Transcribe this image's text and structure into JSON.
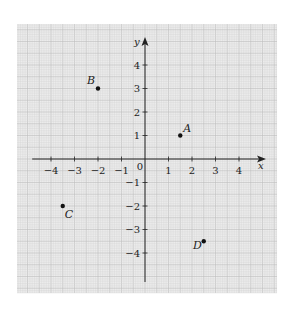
{
  "colors": {
    "page_bg": "#ffffff",
    "grid_bg": "#ececec",
    "grid_minor": "#d4d4d4",
    "grid_major": "#bdbdbd",
    "axis": "#222222",
    "point": "#111111"
  },
  "chart_data": {
    "type": "scatter",
    "title": "",
    "xlabel": "x",
    "ylabel": "y",
    "xlim": [
      -4.8,
      4.9
    ],
    "ylim": [
      -5.2,
      5.2
    ],
    "grid": true,
    "x_ticks": [
      -4,
      -3,
      -2,
      -1,
      1,
      2,
      3,
      4
    ],
    "y_ticks": [
      -4,
      -3,
      -2,
      -1,
      1,
      2,
      3,
      4
    ],
    "x_tick_labels": [
      "−4",
      "−3",
      "−2",
      "−1",
      "1",
      "2",
      "3",
      "4"
    ],
    "y_tick_labels": [
      "−4",
      "−3",
      "−2",
      "−1",
      "1",
      "2",
      "3",
      "4"
    ],
    "origin_label": "0",
    "points": [
      {
        "label": "A",
        "x": 1.5,
        "y": 1,
        "label_pos": "above-right"
      },
      {
        "label": "B",
        "x": -2,
        "y": 3,
        "label_pos": "above-left"
      },
      {
        "label": "C",
        "x": -3.5,
        "y": -2,
        "label_pos": "below-right"
      },
      {
        "label": "D",
        "x": 2.5,
        "y": -3.5,
        "label_pos": "below-left"
      }
    ]
  }
}
